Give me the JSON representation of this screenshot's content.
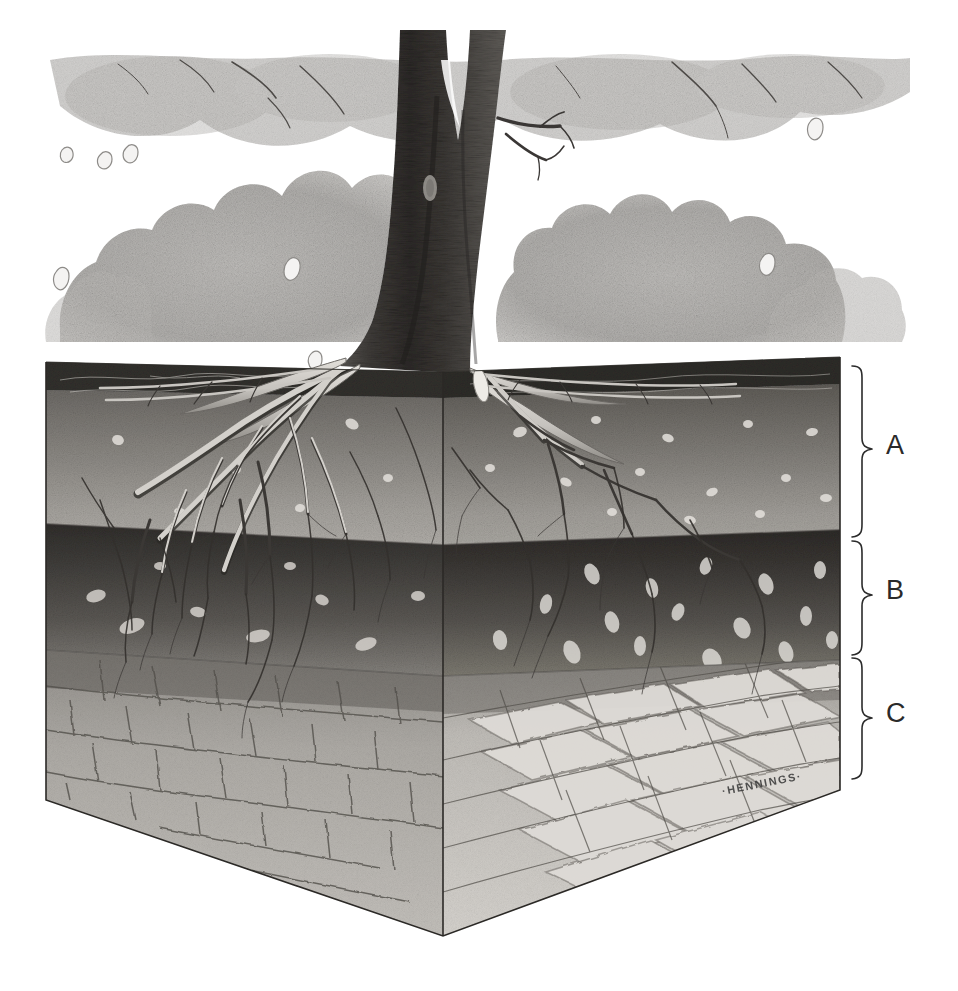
{
  "illustration": {
    "title": "Soil profile block diagram with tree and roots",
    "medium": "graphite pencil scientific illustration",
    "signature": "·HENNINGS·",
    "background_color": "#ffffff"
  },
  "horizons": [
    {
      "key": "A",
      "label": "A",
      "name": "A horizon (topsoil)",
      "bracket_top_y": 365,
      "bracket_bottom_y": 537,
      "label_y": 432,
      "front_color": "#6d6a66",
      "side_color": "#585552",
      "litter_color": "#3a3835"
    },
    {
      "key": "B",
      "label": "B",
      "name": "B horizon (subsoil)",
      "bracket_top_y": 540,
      "bracket_bottom_y": 654,
      "label_y": 577,
      "front_color": "#4f4c49",
      "side_color": "#413f3c"
    },
    {
      "key": "C",
      "label": "C",
      "name": "C horizon (parent rock)",
      "bracket_top_y": 657,
      "bracket_bottom_y": 778,
      "label_y": 700,
      "front_color": "#b9b6b1",
      "side_color": "#cfccc7"
    }
  ],
  "block": {
    "front_corner_x": 443,
    "left_edge_x": 46,
    "right_edge_x": 840,
    "top_left_y": 362,
    "top_right_y": 357,
    "front_corner_top_y": 372,
    "bottom_vertex_x": 443,
    "bottom_vertex_y": 936,
    "left_bottom_y": 800,
    "right_bottom_y": 790
  },
  "tree": {
    "trunk_label": "tree trunk",
    "canopy_label": "shrub canopy",
    "trunk_color": "#474441",
    "canopy_color": "#b0aeab",
    "root_color": "#c9c6c1",
    "falling_leaves_count": 9
  },
  "brackets": {
    "x_spine": 862,
    "x_tip": 874,
    "x_arm": 852,
    "stroke": "#2b2b2b",
    "width": 1.6
  },
  "labels_x": 886
}
